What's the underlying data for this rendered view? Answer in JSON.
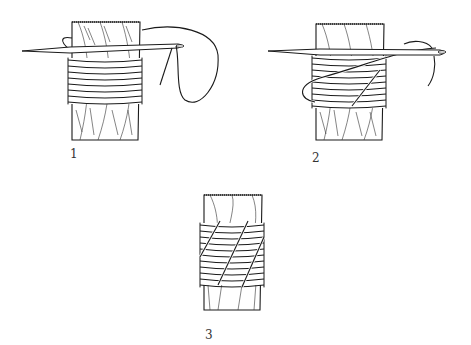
{
  "figure": {
    "panels": [
      {
        "id": 1,
        "label": "1",
        "description": "Needle passed through rope strands with turns of twine wrapped around the rope end"
      },
      {
        "id": 2,
        "label": "2",
        "description": "Twine brought diagonally back over the turns following the lay; needle passed through strand"
      },
      {
        "id": 3,
        "label": "3",
        "description": "Finished whipping with diagonal frapping turns lying in the grooves between strands"
      }
    ]
  },
  "colors": {
    "ink": "#1a1a1a",
    "background": "#ffffff"
  }
}
